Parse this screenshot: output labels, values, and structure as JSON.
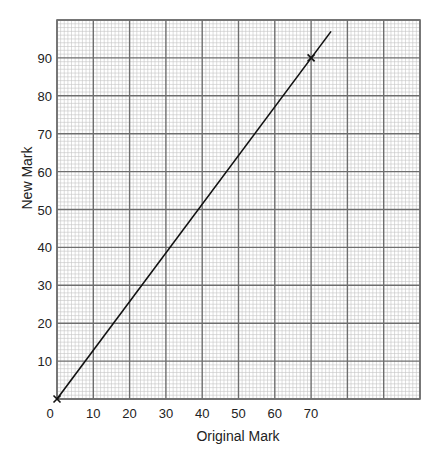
{
  "chart_data": {
    "type": "line",
    "title": "",
    "xlabel": "Original Mark",
    "ylabel": "New Mark",
    "xlim": [
      0,
      100
    ],
    "ylim": [
      0,
      100
    ],
    "x_ticks": [
      0,
      10,
      20,
      30,
      40,
      50,
      60,
      70
    ],
    "y_ticks": [
      10,
      20,
      30,
      40,
      50,
      60,
      70,
      80,
      90
    ],
    "grid": {
      "on": true,
      "major_step": 10,
      "minor_step": 1
    },
    "series": [
      {
        "name": "conversion line",
        "x": [
          0,
          75.5
        ],
        "y": [
          0,
          97
        ],
        "slope": 1.2857
      }
    ],
    "markers": [
      {
        "x": 0,
        "y": 0,
        "symbol": "x"
      },
      {
        "x": 70,
        "y": 90,
        "symbol": "x"
      }
    ],
    "legend": null
  },
  "colors": {
    "major_grid": "#6e6e6e",
    "minor_grid": "#c4c4c4",
    "line": "#111111",
    "text": "#222222"
  }
}
